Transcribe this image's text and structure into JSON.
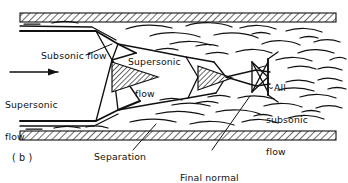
{
  "figure": {
    "panel_label": "( b )",
    "width": 348,
    "height": 183,
    "ink_color": "#111111",
    "background_color": "#ffffff"
  },
  "labels": {
    "subsonic_flow": "Subsonic flow",
    "supersonic_inlet_line1": "Supersonic",
    "supersonic_inlet_line2": "flow",
    "center_supersonic": "Supersonic",
    "center_flow": "flow",
    "all_subsonic_line1": "~All",
    "all_subsonic_line2": "subsonic",
    "all_subsonic_line3": "flow",
    "separation": "Separation",
    "final_shock_line1": "Final normal",
    "final_shock_line2": "shock"
  },
  "icons": {
    "inlet_arrow": "right-arrow-icon"
  },
  "diagram": {
    "type": "supersonic-duct-flow-schematic",
    "walls": [
      {
        "name": "upper-wall",
        "hatched": true
      },
      {
        "name": "lower-wall",
        "hatched": true
      }
    ],
    "features": [
      "oblique-shock-diamond-1",
      "oblique-shock-diamond-2",
      "final-normal-shock",
      "separated-boundary-layer-upper",
      "separated-boundary-layer-lower",
      "supersonic-core-jet",
      "subsonic-outer-flow"
    ]
  }
}
